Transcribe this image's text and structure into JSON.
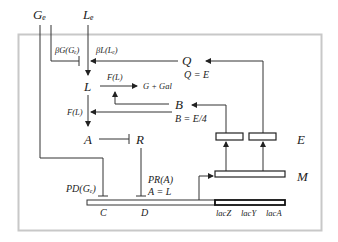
{
  "diagram": {
    "frame_color": "#c8c8c8",
    "line_color": "#333333",
    "inputs": {
      "glucose_external": "Gₑ",
      "lactose_external": "Lₑ"
    },
    "nodes": {
      "lactose_internal": "L",
      "allolactose": "A",
      "repressor": "R",
      "permease_Q": "Q",
      "galactosidase_B": "B",
      "enzyme_E": "E",
      "mRNA_M": "M",
      "region_C": "C",
      "region_D": "D"
    },
    "labels": {
      "beta_G": "βG(Gₑ)",
      "beta_L": "βL(Lₑ)",
      "F_L_top": "F(L)",
      "F_L_left": "F(L)",
      "products": "G + Gal",
      "Q_eq": "Q = E",
      "B_eq": "B = E/4",
      "P_D": "PD(Gₑ)",
      "P_R": "PR(A)",
      "A_eq": "A = L"
    },
    "genes": [
      "lacZ",
      "lacY",
      "lacA"
    ]
  }
}
